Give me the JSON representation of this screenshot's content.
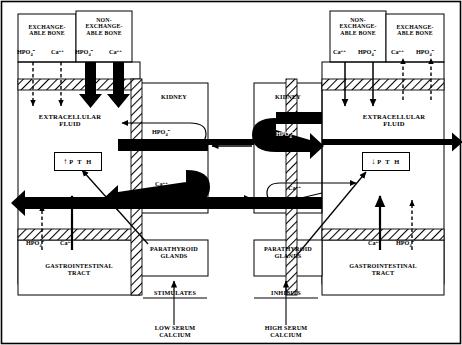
{
  "diagram": {
    "panels": [
      {
        "id": "left",
        "side": "left",
        "trigger": "LOW SERUM\nCALCIUM",
        "effect": "STIMULATES",
        "pth_label": "P T H",
        "pth_direction": "up",
        "pth_arrow": "↑",
        "boxes": {
          "exchangeable_bone": "EXCHANGE-\nABLE BONE",
          "nonexchangeable_bone": "NON-\nEXCHANGE-\nABLE BONE",
          "kidney": "KIDNEY",
          "extracellular_fluid": "EXTRACELLULAR\nFLUID",
          "parathyroid": "PARATHYROID\nGLANDS",
          "gi_tract": "GASTROINTESTINAL\nTRACT"
        },
        "bone_ions": {
          "exchangeable": [
            {
              "ion": "HPO",
              "sub": "4",
              "sup": "=",
              "arrow": "dashed-down"
            },
            {
              "ion": "Ca",
              "sub": "",
              "sup": "++",
              "arrow": "dashed-down"
            }
          ],
          "nonexchangeable": [
            {
              "ion": "HPO",
              "sub": "4",
              "sup": "=",
              "arrow": "thick-down"
            },
            {
              "ion": "Ca",
              "sub": "",
              "sup": "++",
              "arrow": "thick-down"
            }
          ]
        },
        "kidney_flows": [
          {
            "ion": "HPO",
            "sub": "4",
            "sup": "=",
            "style": "thick-out",
            "note": "phosphate excreted"
          },
          {
            "ion": "Ca",
            "sub": "",
            "sup": "++",
            "style": "thick-in",
            "note": "calcium reabsorbed"
          }
        ],
        "gi_ions": [
          {
            "ion": "HPO",
            "sub": "4",
            "sup": "=",
            "arrow": "dashed-up"
          },
          {
            "ion": "Ca",
            "sub": "",
            "sup": "++",
            "arrow": "solid-up"
          }
        ]
      },
      {
        "id": "right",
        "side": "right",
        "trigger": "HIGH SERUM\nCALCIUM",
        "effect": "INHIBITS",
        "pth_label": "P T H",
        "pth_direction": "down",
        "pth_arrow": "↓",
        "boxes": {
          "exchangeable_bone": "EXCHANGE-\nABLE BONE",
          "nonexchangeable_bone": "NON-\nEXCHANGE-\nABLE BONE",
          "kidney": "KIDNEY",
          "extracellular_fluid": "EXTRACELLULAR\nFLUID",
          "parathyroid": "PARATHYROID\nGLANDS",
          "gi_tract": "GASTROINTESTINAL\nTRACT"
        },
        "bone_ions": {
          "nonexchangeable": [
            {
              "ion": "Ca",
              "sub": "",
              "sup": "++",
              "arrow": "thin-down"
            },
            {
              "ion": "HPO",
              "sub": "4",
              "sup": "=",
              "arrow": "thin-down"
            }
          ],
          "exchangeable": [
            {
              "ion": "Ca",
              "sub": "",
              "sup": "++",
              "arrow": "dashed-up"
            },
            {
              "ion": "HPO",
              "sub": "4",
              "sup": "=",
              "arrow": "dashed-up"
            }
          ]
        },
        "kidney_flows": [
          {
            "ion": "HPO",
            "sub": "4",
            "sup": "=",
            "style": "thick-in",
            "note": "phosphate retained"
          },
          {
            "ion": "Ca",
            "sub": "",
            "sup": "++",
            "style": "thick-out",
            "note": "calcium excreted"
          }
        ],
        "gi_ions": [
          {
            "ion": "Ca",
            "sub": "",
            "sup": "++",
            "arrow": "solid-up"
          },
          {
            "ion": "HPO",
            "sub": "4",
            "sup": "=",
            "arrow": "dashed-up"
          }
        ]
      }
    ],
    "colors": {
      "ink": "#000000",
      "paper": "#ffffff",
      "hatch": "#000000"
    }
  }
}
